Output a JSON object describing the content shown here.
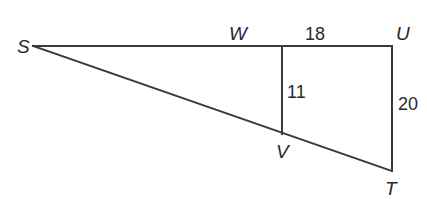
{
  "diagram": {
    "points": {
      "S": {
        "label": "S",
        "x": 33,
        "y": 46
      },
      "W": {
        "label": "W",
        "x": 282,
        "y": 46
      },
      "U": {
        "label": "U",
        "x": 392,
        "y": 46
      },
      "V": {
        "label": "V",
        "x": 282,
        "y": 134
      },
      "T": {
        "label": "T",
        "x": 392,
        "y": 171
      }
    },
    "segments": [
      {
        "from": "S",
        "to": "U"
      },
      {
        "from": "S",
        "to": "T"
      },
      {
        "from": "W",
        "to": "V"
      },
      {
        "from": "U",
        "to": "T"
      }
    ],
    "measures": {
      "WU": "18",
      "WV": "11",
      "UT": "20"
    }
  }
}
